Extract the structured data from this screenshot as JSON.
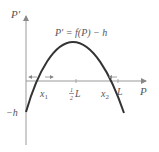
{
  "diagram": {
    "type": "phase-line plot",
    "y_axis_label": "P′",
    "x_axis_label": "P",
    "equation": "P′ = f(P) − h",
    "y_intercept_label": "−h",
    "x_tick_labels": {
      "x1": "x",
      "x1_sub": "1",
      "half_L_num": "1",
      "half_L_den": "2",
      "half_L_var": "L",
      "x2": "x",
      "x2_sub": "2",
      "L": "L"
    },
    "colors": {
      "curve": "#333333",
      "axes": "#888888",
      "text": "#555555"
    }
  }
}
